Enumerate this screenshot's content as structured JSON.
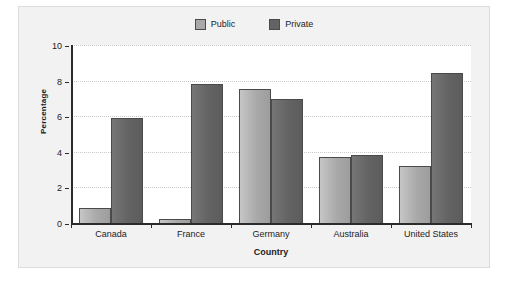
{
  "chart_data": {
    "type": "bar",
    "title": "",
    "subtitle": "",
    "xlabel": "Country",
    "ylabel": "Percentage",
    "categories": [
      "Canada",
      "France",
      "Germany",
      "Australia",
      "United States"
    ],
    "series": [
      {
        "name": "Public",
        "color": "#a9a9a9",
        "values": [
          0.85,
          0.2,
          7.55,
          3.7,
          3.2
        ]
      },
      {
        "name": "Private",
        "color": "#636363",
        "values": [
          5.9,
          7.8,
          6.95,
          3.8,
          8.4
        ]
      }
    ],
    "ylim": [
      0,
      10
    ],
    "yticks": [
      0,
      2,
      4,
      6,
      8,
      10
    ],
    "ytick_labels": [
      "0",
      "2",
      "4",
      "6",
      "8",
      "10"
    ],
    "grid": true,
    "grid_axis": "y",
    "legend_position": "top-center",
    "bar_border_color": "#4a4a4a",
    "plot_background": "#ffffff",
    "frame_background": "#f2f2f2",
    "axis_color": "#2b2b2b",
    "gridline_color": "#c9c9c9"
  },
  "legend": {
    "entries": [
      {
        "label": "Public"
      },
      {
        "label": "Private"
      }
    ]
  }
}
